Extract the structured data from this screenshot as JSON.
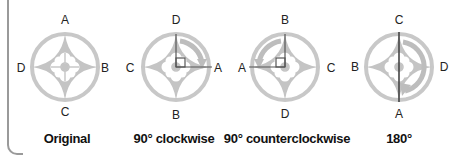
{
  "colors": {
    "emblem": "#c4c4c4",
    "emblem_light": "#d6d6d6",
    "axis_line": "#555555",
    "text": "#222222",
    "bracket": "#9a9a9a"
  },
  "panels": [
    {
      "caption": "Original",
      "center": [
        65,
        67
      ],
      "labels": {
        "top": "A",
        "right": "B",
        "bottom": "C",
        "left": "D"
      },
      "rotation": "none"
    },
    {
      "caption": "90° clockwise",
      "center": [
        176,
        67
      ],
      "labels": {
        "top": "D",
        "right": "A",
        "bottom": "B",
        "left": "C"
      },
      "rotation": "cw90"
    },
    {
      "caption": "90° counterclockwise",
      "center": [
        285,
        67
      ],
      "labels": {
        "top": "B",
        "right": "C",
        "bottom": "D",
        "left": "A"
      },
      "rotation": "ccw90"
    },
    {
      "caption": "180°",
      "center": [
        399,
        67
      ],
      "labels": {
        "top": "C",
        "right": "D",
        "bottom": "A",
        "left": "B"
      },
      "rotation": "180"
    }
  ]
}
